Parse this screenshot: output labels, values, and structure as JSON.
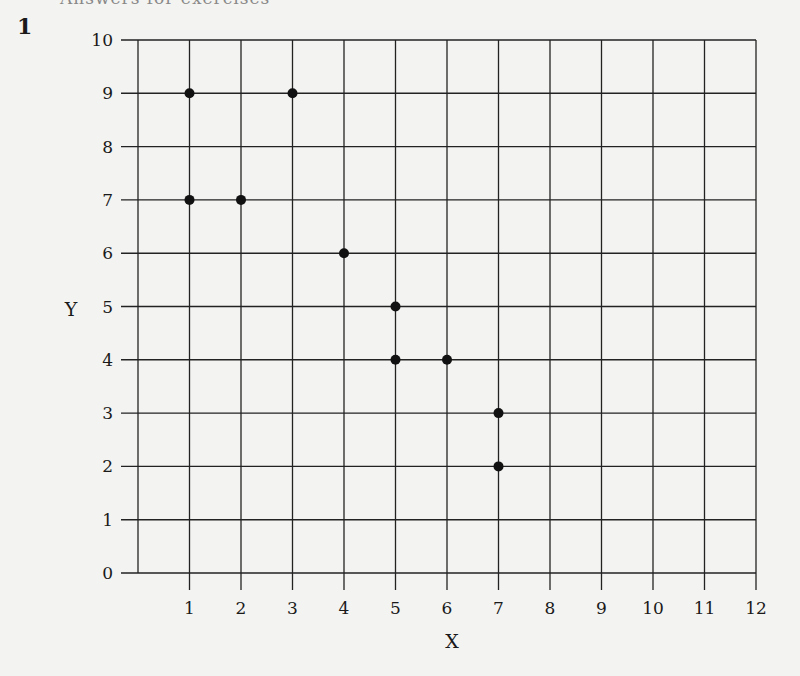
{
  "page": {
    "question_number": "1",
    "header_partial": "Answers for exercises"
  },
  "chart_data": {
    "type": "scatter",
    "title": "",
    "xlabel": "X",
    "ylabel": "Y",
    "xlim": [
      0,
      12
    ],
    "ylim": [
      0,
      10
    ],
    "grid": true,
    "x_ticks": [
      "1",
      "2",
      "3",
      "4",
      "5",
      "6",
      "7",
      "8",
      "9",
      "10",
      "11",
      "12"
    ],
    "y_ticks": [
      "0",
      "1",
      "2",
      "3",
      "4",
      "5",
      "6",
      "7",
      "8",
      "9",
      "10"
    ],
    "points": [
      {
        "x": 1,
        "y": 9
      },
      {
        "x": 3,
        "y": 9
      },
      {
        "x": 1,
        "y": 7
      },
      {
        "x": 2,
        "y": 7
      },
      {
        "x": 4,
        "y": 6
      },
      {
        "x": 5,
        "y": 5
      },
      {
        "x": 5,
        "y": 4
      },
      {
        "x": 6,
        "y": 4
      },
      {
        "x": 7,
        "y": 3
      },
      {
        "x": 7,
        "y": 2
      }
    ],
    "legend": null
  }
}
